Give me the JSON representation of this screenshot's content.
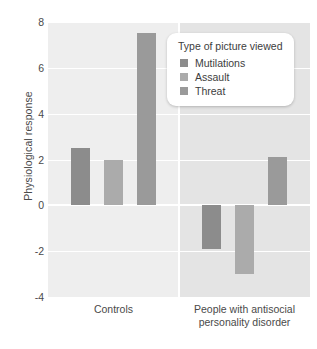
{
  "chart_data": {
    "type": "bar",
    "title": "",
    "xlabel": "",
    "ylabel": "Physiological response",
    "ylim": [
      -4,
      8
    ],
    "yticks": [
      8,
      6,
      4,
      2,
      0,
      -2,
      -4
    ],
    "ytick_labels": [
      "8",
      "6",
      "4",
      "2",
      "0",
      "-2",
      "-4"
    ],
    "grid": true,
    "legend_position": "upper-right-inside",
    "legend_title": "Type of picture viewed",
    "categories": [
      "Controls",
      "People with antisocial personality disorder"
    ],
    "category_lines": [
      [
        "Controls"
      ],
      [
        "People with antisocial",
        "personality disorder"
      ]
    ],
    "series": [
      {
        "name": "Mutilations",
        "color": "#8c8c8c",
        "values": [
          2.5,
          -1.9
        ]
      },
      {
        "name": "Assault",
        "color": "#ababab",
        "values": [
          2.0,
          -3.0
        ]
      },
      {
        "name": "Threat",
        "color": "#9a9a9a",
        "values": [
          7.5,
          2.1
        ]
      }
    ]
  },
  "axis": {
    "y_title": "Physiological response",
    "tick_labels": [
      "8",
      "6",
      "4",
      "2",
      "0",
      "-2",
      "-4"
    ]
  },
  "legend": {
    "title": "Type of picture viewed",
    "items": [
      {
        "label": "Mutilations",
        "color": "#8c8c8c"
      },
      {
        "label": "Assault",
        "color": "#ababab"
      },
      {
        "label": "Threat",
        "color": "#9a9a9a"
      }
    ]
  },
  "xaxis": {
    "group0_line0": "Controls",
    "group1_line0": "People with antisocial",
    "group1_line1": "personality disorder"
  },
  "colors": {
    "panel_left": "#eeeeee",
    "panel_right": "#e4e4e4",
    "gridline": "#ffffff",
    "text": "#4a4a4a"
  }
}
